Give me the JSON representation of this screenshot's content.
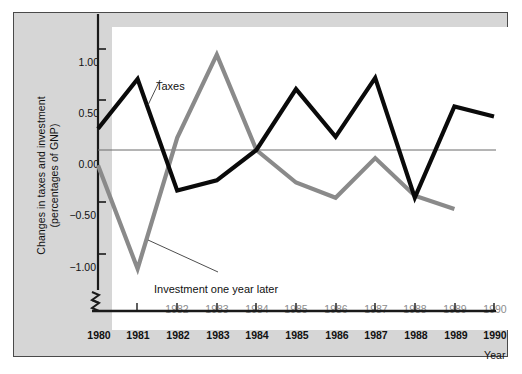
{
  "chart_data": {
    "type": "line",
    "title": "",
    "subtitle": "",
    "ylabel": "Changes in taxes and investment (percentages of GNP)",
    "ylabel_line1": "Changes in taxes and investment",
    "ylabel_line2": "(percentages of GNP)",
    "xlabel": "Year",
    "ylim": [
      -1.3,
      1.15
    ],
    "yticks": [
      1.0,
      0.5,
      0.0,
      -0.5,
      -1.0
    ],
    "ytick_labels": [
      "1.00",
      "0.50",
      "0.00",
      "−0.50",
      "−1.00"
    ],
    "grid": false,
    "zero_line": true,
    "axis_break": true,
    "legend": "inline-annotations",
    "x": [
      1980,
      1981,
      1982,
      1983,
      1984,
      1985,
      1986,
      1987,
      1988,
      1989,
      1990
    ],
    "xtick_labels_lower": [
      "1980",
      "1981",
      "1982",
      "1983",
      "1984",
      "1985",
      "1986",
      "1987",
      "1988",
      "1989",
      "1990"
    ],
    "xtick_labels_upper": [
      "",
      "1982",
      "1983",
      "1984",
      "1985",
      "1986",
      "1987",
      "1988",
      "1989",
      "1990",
      ""
    ],
    "series": [
      {
        "name": "Taxes",
        "color": "#0a0a0a",
        "values": [
          0.21,
          0.7,
          -0.4,
          -0.3,
          0.0,
          0.6,
          0.13,
          0.71,
          -0.47,
          0.43,
          0.33
        ]
      },
      {
        "name": "Investment one year later",
        "color": "#8a8a8a",
        "values": [
          -0.15,
          -1.17,
          0.12,
          0.94,
          0.0,
          -0.32,
          -0.47,
          -0.08,
          -0.45,
          -0.58,
          null
        ]
      }
    ],
    "annotations": [
      {
        "text": "Taxes",
        "target_series": "Taxes"
      },
      {
        "text": "Investment one year later",
        "target_series": "Investment one year later"
      }
    ]
  },
  "colors": {
    "taxes_line": "#0a0a0a",
    "investment_line": "#8a8a8a",
    "frame_border": "#4a4a4a",
    "figure_background": "#d6d6d6",
    "plot_background": "#ffffff",
    "axis": "#1a1a1a",
    "zero_line": "#6a6a6a",
    "upper_tick_text": "#8c8c8c",
    "lower_tick_text": "#111111"
  }
}
